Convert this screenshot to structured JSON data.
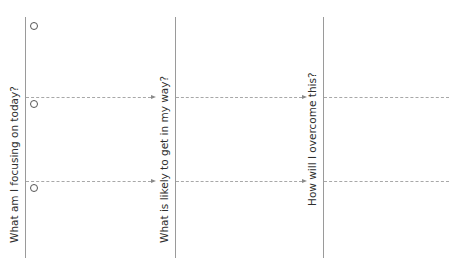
{
  "columns": [
    {
      "label": "What am I focusing on today?"
    },
    {
      "label": "What is likely to get in my way?"
    },
    {
      "label": "How will I overcome this?"
    }
  ],
  "rows": [
    {
      "marker": "circle"
    },
    {
      "marker": "circle"
    },
    {
      "marker": "circle"
    }
  ],
  "colors": {
    "line": "#9a9a9a",
    "text": "#2e2e2e",
    "background": "#ffffff"
  }
}
